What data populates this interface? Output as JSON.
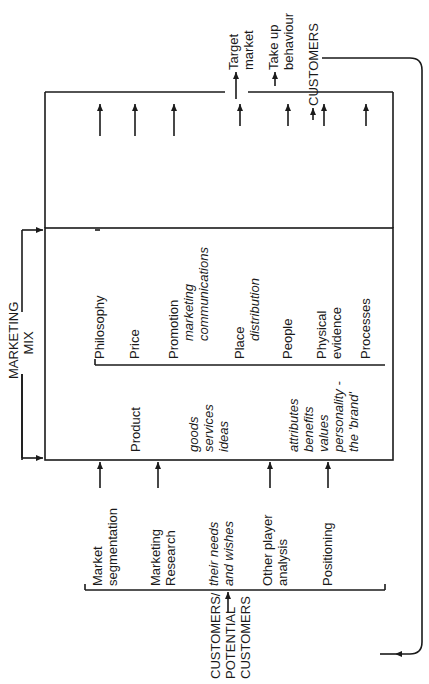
{
  "diagram": {
    "title": "MARKETING MIX",
    "inputs_side": {
      "source": "CUSTOMERS/ POTENTIAL CUSTOMERS",
      "source_lines": [
        "CUSTOMERS/",
        "POTENTIAL",
        "CUSTOMERS"
      ],
      "items": [
        {
          "lines": [
            "Market",
            "segmentation"
          ]
        },
        {
          "lines": [
            "Marketing",
            "Research"
          ]
        },
        {
          "lines": [
            "their needs",
            "and wishes"
          ],
          "italic": true
        },
        {
          "lines": [
            "Other player",
            "analysis"
          ]
        },
        {
          "lines": [
            "Positioning"
          ]
        }
      ]
    },
    "marketing_mix": {
      "title_lines": [
        "MARKETING",
        "MIX"
      ],
      "product": {
        "label": "Product",
        "sub1": [
          "goods",
          "services",
          "ideas"
        ],
        "sub2": [
          "attributes",
          "benefits",
          "values",
          "personality -",
          "the 'brand'"
        ]
      },
      "elements": [
        {
          "lines": [
            "Philosophy"
          ]
        },
        {
          "lines": [
            "Price"
          ]
        },
        {
          "lines": [
            "Promotion"
          ],
          "sub": [
            "marketing",
            "communications"
          ]
        },
        {
          "lines": [
            "Place"
          ],
          "sub": [
            "distribution"
          ]
        },
        {
          "lines": [
            "People"
          ]
        },
        {
          "lines": [
            "Physical",
            "evidence"
          ]
        },
        {
          "lines": [
            "Processes"
          ]
        }
      ]
    },
    "outputs": {
      "target_market": [
        "Target",
        "market"
      ],
      "take_up": [
        "Take up",
        "behaviour"
      ],
      "customers": "CUSTOMERS"
    },
    "colors": {
      "line": "#1a1a1a",
      "background": "#ffffff"
    }
  }
}
